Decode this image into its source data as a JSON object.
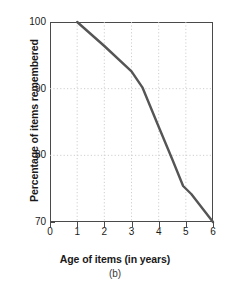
{
  "chart_data": {
    "type": "line",
    "title": "",
    "subtitle": "",
    "xlabel": "Age of items (in years)",
    "ylabel": "Percentage of items remembered",
    "caption": "(b)",
    "xlim": [
      0,
      6
    ],
    "ylim": [
      70,
      100
    ],
    "x_ticks": [
      0,
      1,
      2,
      3,
      4,
      5,
      6
    ],
    "x_tick_labels": [
      "0",
      "1",
      "2",
      "3",
      "4",
      "5",
      "6"
    ],
    "y_ticks": [
      70,
      80,
      90,
      100
    ],
    "y_tick_labels": [
      "70",
      "80",
      "90",
      "100"
    ],
    "grid": true,
    "grid_style": "dotted",
    "grid_color": "#c9c9c9",
    "legend": null,
    "series": [
      {
        "name": "Percentage of items remembered",
        "color": "#555555",
        "line_width": 2.4,
        "x": [
          1,
          2,
          3,
          3.4,
          4,
          4.5,
          4.9,
          5.2,
          6
        ],
        "y": [
          100,
          96.4,
          92.6,
          90.2,
          84.3,
          79.4,
          75.4,
          74.2,
          70.0
        ]
      }
    ]
  },
  "axis_title_y": "Percentage of items remembered",
  "axis_title_x": "Age of items (in years)",
  "panel_label": "(b)",
  "ytick_labels": {
    "t0": "100",
    "t1": "90",
    "t2": "80",
    "t3": "70"
  },
  "xtick_labels": {
    "t0": "0",
    "t1": "1",
    "t2": "2",
    "t3": "3",
    "t4": "4",
    "t5": "5",
    "t6": "6"
  },
  "colors": {
    "line": "#555555",
    "axis": "#4a4a4a",
    "grid": "#c9c9c9",
    "text": "#1a1a1a",
    "background": "#ffffff"
  }
}
